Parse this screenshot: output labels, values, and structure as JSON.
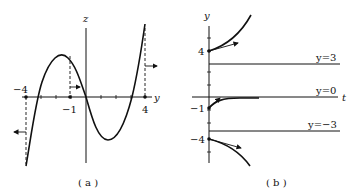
{
  "panel_a": {
    "caption": "( a )",
    "horizontal_axis_label": "y",
    "vertical_axis_label": "z",
    "tick_labels": [
      "−4",
      "−1",
      "4"
    ]
  },
  "panel_b": {
    "caption": "( b )",
    "horizontal_axis_label": "t",
    "vertical_axis_label": "y",
    "tick_labels": [
      "4",
      "−1",
      "−4"
    ],
    "equilibrium_labels": [
      "y=3",
      "y=0",
      "y=−3"
    ]
  },
  "colors": {
    "ink": "#111111",
    "background": "#ffffff"
  }
}
